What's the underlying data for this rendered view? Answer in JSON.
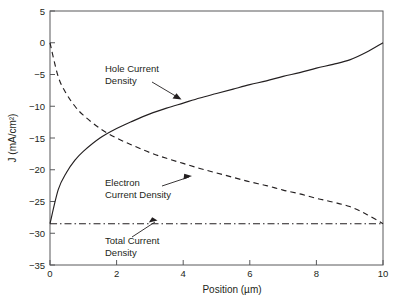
{
  "chart_data": {
    "type": "line",
    "title": "",
    "xlabel": "Position (µm)",
    "ylabel": "J (mA/cm²)",
    "xlim": [
      0,
      10
    ],
    "ylim": [
      -35,
      5
    ],
    "xticks": [
      "0",
      "2",
      "4",
      "6",
      "8",
      "10"
    ],
    "xtick_values": [
      0,
      2,
      4,
      6,
      8,
      10
    ],
    "yticks": [
      "5",
      "0",
      "−5",
      "−10",
      "−15",
      "−20",
      "−25",
      "−30",
      "−35"
    ],
    "ytick_values": [
      5,
      0,
      -5,
      -10,
      -15,
      -20,
      -25,
      -30,
      -35
    ],
    "grid": false,
    "legend": "none (inline annotations with leader lines)",
    "x": [
      0,
      0.25,
      0.5,
      0.75,
      1,
      1.5,
      2,
      2.5,
      3,
      3.5,
      4,
      4.5,
      5,
      5.5,
      6,
      6.5,
      7,
      7.5,
      8,
      8.5,
      9,
      9.5,
      10
    ],
    "series": [
      {
        "name": "Hole Current Density",
        "style": "solid",
        "values": [
          -28.5,
          -23.1,
          -20.4,
          -18.5,
          -17.1,
          -15.0,
          -13.5,
          -12.3,
          -11.2,
          -10.3,
          -9.5,
          -8.7,
          -8.0,
          -7.3,
          -6.6,
          -6.0,
          -5.3,
          -4.7,
          -4.0,
          -3.4,
          -2.7,
          -1.5,
          0.0
        ]
      },
      {
        "name": "Electron Current Density",
        "style": "dashed",
        "values": [
          0.0,
          -5.4,
          -8.1,
          -10.0,
          -11.4,
          -13.5,
          -15.0,
          -16.2,
          -17.3,
          -18.2,
          -19.0,
          -19.8,
          -20.5,
          -21.2,
          -21.9,
          -22.5,
          -23.2,
          -23.8,
          -24.5,
          -25.1,
          -25.8,
          -27.0,
          -28.5
        ]
      },
      {
        "name": "Total Current Density",
        "style": "dash-dot",
        "values": [
          -28.5,
          -28.5,
          -28.5,
          -28.5,
          -28.5,
          -28.5,
          -28.5,
          -28.5,
          -28.5,
          -28.5,
          -28.5,
          -28.5,
          -28.5,
          -28.5,
          -28.5,
          -28.5,
          -28.5,
          -28.5,
          -28.5,
          -28.5,
          -28.5,
          -28.5,
          -28.5
        ]
      }
    ],
    "annotations": [
      {
        "label_line1": "Hole Current",
        "label_line2": "Density",
        "points_to_series": "Hole Current Density",
        "points_to_xy": [
          3.55,
          -9.6
        ]
      },
      {
        "label_line1": "Electron",
        "label_line2": "Current Density",
        "points_to_series": "Electron Current Density",
        "points_to_xy": [
          4.25,
          -20.5
        ]
      },
      {
        "label_line1": "Total Current",
        "label_line2": "Density",
        "points_to_series": "Total Current Density",
        "points_to_xy": [
          3.3,
          -28.5
        ]
      }
    ],
    "colors": {
      "curve": "#231f20",
      "frame": "#58595b",
      "background": "#ffffff"
    }
  }
}
